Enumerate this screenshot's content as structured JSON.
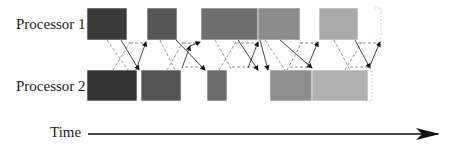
{
  "diagram": {
    "type": "timeline-schedule",
    "rows": [
      {
        "label": "Processor 1",
        "y": 8,
        "height": 32,
        "blocks": [
          {
            "x0": 87,
            "x1": 127,
            "color": "#3a3a3a"
          },
          {
            "x0": 147,
            "x1": 177,
            "color": "#565656"
          },
          {
            "x0": 201,
            "x1": 258,
            "color": "#6f6f6f"
          },
          {
            "x0": 258,
            "x1": 300,
            "color": "#8a8a8a"
          },
          {
            "x0": 319,
            "x1": 358,
            "color": "#aaaaaa"
          }
        ],
        "dotted_end_x": 381
      },
      {
        "label": "Processor 2",
        "y": 70,
        "height": 31,
        "blocks": [
          {
            "x0": 87,
            "x1": 137,
            "color": "#333333"
          },
          {
            "x0": 141,
            "x1": 181,
            "color": "#555555"
          },
          {
            "x0": 207,
            "x1": 227,
            "color": "#6d6d6d"
          },
          {
            "x0": 270,
            "x1": 312,
            "color": "#8d8d8d"
          },
          {
            "x0": 312,
            "x1": 368,
            "color": "#b0b0b0"
          }
        ],
        "dotted_end_x": 372
      }
    ],
    "solid_arrows": [
      {
        "from": [
          121,
          40
        ],
        "to": [
          139,
          70
        ]
      },
      {
        "from": [
          136,
          70
        ],
        "to": [
          146,
          42
        ]
      },
      {
        "from": [
          176,
          40
        ],
        "to": [
          205,
          70
        ]
      },
      {
        "from": [
          182,
          68
        ],
        "to": [
          190,
          46
        ]
      },
      {
        "from": [
          190,
          46
        ],
        "to": [
          200,
          42
        ]
      },
      {
        "from": [
          238,
          40
        ],
        "to": [
          258,
          70
        ]
      },
      {
        "from": [
          248,
          68
        ],
        "to": [
          258,
          42
        ]
      },
      {
        "from": [
          260,
          40
        ],
        "to": [
          268,
          70
        ]
      },
      {
        "from": [
          280,
          40
        ],
        "to": [
          312,
          68
        ]
      },
      {
        "from": [
          307,
          68
        ],
        "to": [
          318,
          42
        ]
      },
      {
        "from": [
          355,
          40
        ],
        "to": [
          370,
          68
        ]
      },
      {
        "from": [
          369,
          68
        ],
        "to": [
          380,
          42
        ]
      }
    ],
    "dashed_lines": [
      [
        [
          107,
          40
        ],
        [
          128,
          70
        ]
      ],
      [
        [
          113,
          70
        ],
        [
          130,
          42
        ]
      ],
      [
        [
          130,
          43
        ],
        [
          146,
          43
        ]
      ],
      [
        [
          160,
          40
        ],
        [
          175,
          70
        ]
      ],
      [
        [
          167,
          70
        ],
        [
          183,
          42
        ]
      ],
      [
        [
          183,
          43
        ],
        [
          200,
          43
        ]
      ],
      [
        [
          185,
          67
        ],
        [
          205,
          67
        ]
      ],
      [
        [
          215,
          40
        ],
        [
          232,
          70
        ]
      ],
      [
        [
          219,
          70
        ],
        [
          236,
          42
        ]
      ],
      [
        [
          232,
          67
        ],
        [
          258,
          67
        ]
      ],
      [
        [
          236,
          43
        ],
        [
          258,
          43
        ]
      ],
      [
        [
          265,
          40
        ],
        [
          285,
          70
        ]
      ],
      [
        [
          287,
          70
        ],
        [
          302,
          42
        ]
      ],
      [
        [
          300,
          43
        ],
        [
          318,
          43
        ]
      ],
      [
        [
          290,
          67
        ],
        [
          312,
          67
        ]
      ],
      [
        [
          334,
          40
        ],
        [
          350,
          70
        ]
      ],
      [
        [
          345,
          70
        ],
        [
          362,
          42
        ]
      ],
      [
        [
          358,
          43
        ],
        [
          380,
          43
        ]
      ],
      [
        [
          350,
          67
        ],
        [
          368,
          67
        ]
      ]
    ],
    "axis": {
      "label": "Time",
      "x0": 88,
      "x1": 438,
      "y": 134
    }
  }
}
